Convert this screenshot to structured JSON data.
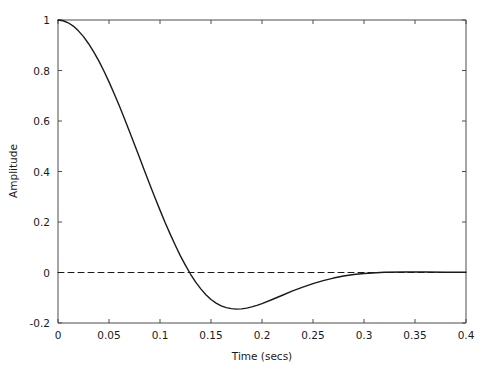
{
  "chart_data": {
    "type": "line",
    "title": "",
    "xlabel": "Time (secs)",
    "ylabel": "Amplitude",
    "xlim": [
      0,
      0.4
    ],
    "ylim": [
      -0.2,
      1.0
    ],
    "grid": false,
    "legend": null,
    "xticks": [
      0,
      0.05,
      0.1,
      0.15,
      0.2,
      0.25,
      0.3,
      0.35,
      0.4
    ],
    "xticklabels": [
      "0",
      "0.05",
      "0.1",
      "0.15",
      "0.2",
      "0.25",
      "0.3",
      "0.35",
      "0.4"
    ],
    "yticks": [
      -0.2,
      0,
      0.2,
      0.4,
      0.6,
      0.8,
      1
    ],
    "yticklabels": [
      "-0.2",
      "0",
      "0.2",
      "0.4",
      "0.6",
      "0.8",
      "1"
    ],
    "series": [
      {
        "name": "impulse-response",
        "style": "solid",
        "color": "#1a1a1a",
        "linewidth": 1.4,
        "x": [
          0,
          0.005,
          0.01,
          0.015,
          0.02,
          0.025,
          0.03,
          0.035,
          0.04,
          0.045,
          0.05,
          0.055,
          0.06,
          0.065,
          0.07,
          0.075,
          0.08,
          0.085,
          0.09,
          0.095,
          0.1,
          0.105,
          0.11,
          0.115,
          0.12,
          0.125,
          0.13,
          0.135,
          0.14,
          0.145,
          0.15,
          0.155,
          0.16,
          0.165,
          0.17,
          0.175,
          0.18,
          0.185,
          0.19,
          0.195,
          0.2,
          0.21,
          0.22,
          0.23,
          0.24,
          0.25,
          0.26,
          0.27,
          0.28,
          0.29,
          0.3,
          0.32,
          0.34,
          0.36,
          0.38,
          0.4
        ],
        "y": [
          1.0,
          0.997,
          0.989,
          0.976,
          0.957,
          0.934,
          0.906,
          0.874,
          0.838,
          0.798,
          0.755,
          0.709,
          0.661,
          0.611,
          0.559,
          0.507,
          0.454,
          0.401,
          0.349,
          0.297,
          0.247,
          0.198,
          0.152,
          0.108,
          0.066,
          0.028,
          -0.007,
          -0.038,
          -0.065,
          -0.088,
          -0.107,
          -0.121,
          -0.132,
          -0.139,
          -0.143,
          -0.145,
          -0.144,
          -0.141,
          -0.136,
          -0.13,
          -0.123,
          -0.107,
          -0.09,
          -0.073,
          -0.058,
          -0.044,
          -0.032,
          -0.022,
          -0.014,
          -0.008,
          -0.004,
          0.001,
          0.002,
          0.002,
          0.001,
          0.001
        ]
      },
      {
        "name": "zero-reference-line",
        "style": "dashed",
        "color": "#1a1a1a",
        "linewidth": 1.0,
        "x": [
          0,
          0.4
        ],
        "y": [
          0,
          0
        ]
      }
    ],
    "annotations": {
      "zero_crossing_t": 0.129,
      "minimum_t": 0.175,
      "minimum_value": -0.047,
      "initial_value": 1.0,
      "settles_near_zero_t": 0.3
    }
  }
}
